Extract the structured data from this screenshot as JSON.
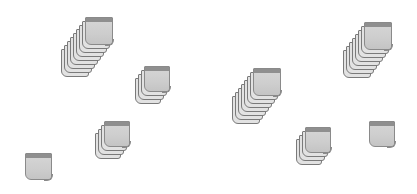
{
  "canvas": {
    "width": 417,
    "height": 194,
    "background": "#ffffff"
  },
  "colors": {
    "card_face": "#cfcfcf",
    "card_strip": "#8f8f8f",
    "card_edge": "#8a8a8a",
    "back_layer": "#e2e2e2"
  },
  "stacks": [
    {
      "name": "stack-1",
      "x": 85,
      "y": 17,
      "size": 28,
      "layers": 9,
      "dx": -3,
      "dy": 4
    },
    {
      "name": "stack-2",
      "x": 144,
      "y": 66,
      "size": 26,
      "layers": 4,
      "dx": -3,
      "dy": 4
    },
    {
      "name": "stack-3",
      "x": 104,
      "y": 121,
      "size": 26,
      "layers": 4,
      "dx": -3,
      "dy": 4
    },
    {
      "name": "stack-4",
      "x": 25,
      "y": 153,
      "size": 27,
      "layers": 1,
      "dx": 0,
      "dy": 0
    },
    {
      "name": "stack-5",
      "x": 253,
      "y": 68,
      "size": 28,
      "layers": 8,
      "dx": -3,
      "dy": 4
    },
    {
      "name": "stack-6",
      "x": 364,
      "y": 22,
      "size": 28,
      "layers": 8,
      "dx": -3,
      "dy": 4
    },
    {
      "name": "stack-7",
      "x": 305,
      "y": 127,
      "size": 26,
      "layers": 4,
      "dx": -3,
      "dy": 4
    },
    {
      "name": "stack-8",
      "x": 369,
      "y": 121,
      "size": 26,
      "layers": 1,
      "dx": 0,
      "dy": 0
    }
  ]
}
